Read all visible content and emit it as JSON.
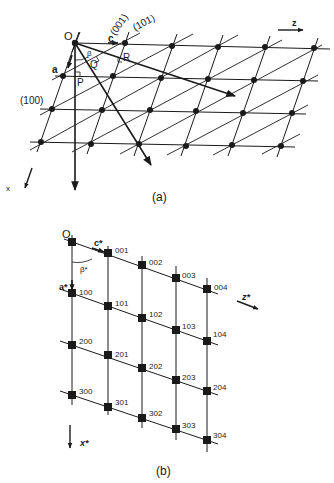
{
  "figure": {
    "panel_a": {
      "caption": "(a)",
      "labels": {
        "origin": "O",
        "a_vec": "a",
        "c_vec": "c",
        "beta": "β",
        "P": "P",
        "Q": "Q",
        "R": "R",
        "plane_001": "(001)",
        "plane_101": "(101)",
        "plane_100": "(100)",
        "x_axis": "x",
        "z_axis": "z"
      }
    },
    "panel_b": {
      "caption": "(b)",
      "labels": {
        "origin": "O",
        "a_star": "a*",
        "c_star": "c*",
        "beta_star": "β*",
        "x_star": "x*",
        "z_star": "z*"
      },
      "points": [
        [
          "",
          "001",
          "002",
          "003",
          "004"
        ],
        [
          "100",
          "101",
          "102",
          "103",
          "104"
        ],
        [
          "200",
          "201",
          "202",
          "203",
          "204"
        ],
        [
          "300",
          "301",
          "302",
          "303",
          "304"
        ]
      ]
    },
    "colors": {
      "ink": "#1a1a1a",
      "background": "#ffffff"
    }
  }
}
